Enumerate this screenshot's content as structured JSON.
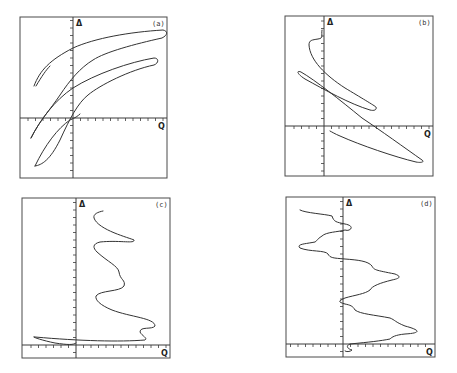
{
  "chart_data": [
    {
      "type": "line",
      "panel": "(a)",
      "xlabel": "Q",
      "ylabel": "Δ",
      "grid": false,
      "frame": {
        "x": 20,
        "y": 17,
        "w": 147,
        "h": 161
      },
      "origin": {
        "x": 73,
        "y": 118
      },
      "description": "Three nested elongated loops rising from lower-left to upper-right (hysteresis-like phase portrait), plus a short stub segment near top-left",
      "paths": [
        "M 34 86 C 40 70, 50 60, 73 48 C 95 38, 130 32, 163 30 C 168 31, 168 35, 162 38 C 135 44, 105 52, 93 60 C 80 68, 70 80, 60 95 C 50 110, 40 120, 31 138",
        "M 36 86 C 42 76, 46 70, 50 66",
        "M 31 138 C 40 120, 55 100, 73 88 C 95 74, 130 62, 154 58 C 159 58, 159 63, 154 65 C 130 70, 100 85, 88 95 C 78 103, 70 118, 60 140 C 50 160, 42 165, 35 166",
        "M 35 166 C 45 145, 58 128, 70 120 C 75 118, 78 116, 80 114"
      ]
    },
    {
      "type": "line",
      "panel": "(b)",
      "xlabel": "Q",
      "ylabel": "Δ",
      "grid": false,
      "frame": {
        "x": 285,
        "y": 16,
        "w": 148,
        "h": 160
      },
      "origin": {
        "x": 324,
        "y": 126
      },
      "description": "Loops descending from upper-left to lower-right, starting with a small wiggle near top of Δ-axis",
      "paths": [
        "M 322 30 C 321 36, 324 38, 318 39 C 312 40, 309 40, 309 45 C 310 60, 325 75, 345 88 C 360 97, 375 106, 376 107 C 377 110, 374 111, 370 110 C 350 104, 325 90, 305 79 C 297 74, 296 70, 301 72 C 315 80, 340 100, 362 118 C 380 130, 405 148, 422 160 C 425 162, 421 163, 416 162 C 395 157, 360 145, 340 136 C 335 134, 332 132, 330 131"
      ]
    },
    {
      "type": "line",
      "panel": "(c)",
      "xlabel": "Q",
      "ylabel": "Δ",
      "grid": false,
      "frame": {
        "x": 22,
        "y": 198,
        "w": 148,
        "h": 160
      },
      "origin": {
        "x": 76,
        "y": 345
      },
      "description": "Oscillating trajectory in positive-Q region moving downward in Δ with a sharp excursion to negative Q near the bottom",
      "paths": [
        "M 103 211 C 98 212, 93 214, 94 218 C 98 230, 130 238, 134 240 C 135 244, 120 240, 100 242 C 92 244, 93 248, 97 252 C 108 262, 118 266, 119 272 C 120 280, 126 280, 124 286 C 120 292, 100 290, 96 296 C 95 300, 100 305, 112 310 C 130 317, 155 318, 155 326 C 152 330, 140 326, 140 332 C 142 336, 148 338, 145 340 C 120 342, 80 341, 35 337 C 30 336, 40 340, 55 343 C 68 345, 74 345, 76 343"
      ]
    },
    {
      "type": "line",
      "panel": "(d)",
      "xlabel": "Q",
      "ylabel": "Δ",
      "grid": false,
      "frame": {
        "x": 286,
        "y": 197,
        "w": 149,
        "h": 160
      },
      "origin": {
        "x": 343,
        "y": 344
      },
      "description": "Irregular oscillating trajectory with step-like plateaus, alternating between negative and positive Q while descending in Δ",
      "paths": [
        "M 300 210 C 305 213, 325 214, 332 216 C 334 222, 336 222, 345 224 C 356 226, 350 232, 345 230 C 338 232, 326 232, 322 236 C 316 240, 318 240, 315 242 C 305 244, 296 244, 300 248 C 310 252, 325 250, 328 254 C 330 258, 333 258, 345 259 C 358 260, 368 261, 372 266 C 374 270, 375 270, 395 274 C 400 276, 402 278, 392 280 C 380 283, 372 286, 370 290 C 365 294, 355 295, 345 298 C 338 301, 338 302, 345 304 C 350 305, 353 306, 355 310 C 360 314, 375 315, 390 318 C 395 320, 395 322, 405 326 C 420 330, 422 333, 405 334 C 395 335, 392 337, 390 339 C 380 341, 370 342, 350 344 C 345 346, 348 349, 352 350 C 350 352, 346 352, 345 351"
      ]
    }
  ],
  "panels": [
    {
      "tag": "(a)",
      "xlabel": "Q",
      "ylabel": "Δ"
    },
    {
      "tag": "(b)",
      "xlabel": "Q",
      "ylabel": "Δ"
    },
    {
      "tag": "(c)",
      "xlabel": "Q",
      "ylabel": "Δ"
    },
    {
      "tag": "(d)",
      "xlabel": "Q",
      "ylabel": "Δ"
    }
  ],
  "colors": {
    "line": "#333333",
    "frame": "#4a4a4a",
    "background": "#ffffff"
  }
}
